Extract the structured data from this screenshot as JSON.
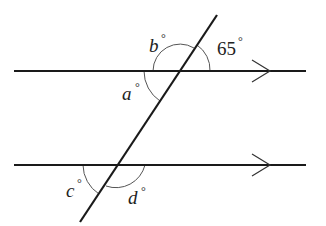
{
  "diagram": {
    "colors": {
      "line": "#1a1a1a",
      "arc": "#555555",
      "background": "#ffffff"
    },
    "parallel_lines": [
      {
        "name": "top-line",
        "y": 71,
        "x1": 14,
        "x2": 306,
        "arrow_x": 270
      },
      {
        "name": "bottom-line",
        "y": 165,
        "x1": 14,
        "x2": 306,
        "arrow_x": 270
      }
    ],
    "transversal": {
      "x1": 217,
      "y1": 15,
      "x2": 80,
      "y2": 222
    },
    "angles": [
      {
        "id": "b",
        "var": "b",
        "symbol": "°",
        "label": "b°",
        "position": "top-left, above top line"
      },
      {
        "id": "65",
        "var": "65",
        "symbol": "°",
        "label": "65°",
        "position": "top-right, above top line"
      },
      {
        "id": "a",
        "var": "a",
        "symbol": "°",
        "label": "a°",
        "position": "bottom-left, below top line"
      },
      {
        "id": "c",
        "var": "c",
        "symbol": "°",
        "label": "c°",
        "position": "bottom-left, below bottom line"
      },
      {
        "id": "d",
        "var": "d",
        "symbol": "°",
        "label": "d°",
        "position": "bottom-right, below bottom line"
      }
    ]
  }
}
